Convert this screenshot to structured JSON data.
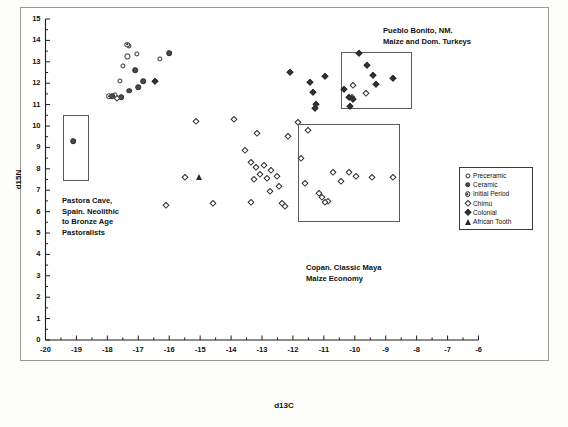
{
  "axes": {
    "xlabel": "d13C",
    "ylabel": "d15N",
    "xticks": [
      "-20",
      "-19",
      "-18",
      "-17",
      "-16",
      "-15",
      "-14",
      "-13",
      "-12",
      "-11",
      "-10",
      "-9",
      "-8",
      "-7",
      "-6"
    ],
    "yticks": [
      "0",
      "1",
      "2",
      "3",
      "4",
      "5",
      "6",
      "7",
      "8",
      "9",
      "10",
      "11",
      "12",
      "13",
      "14",
      "15"
    ],
    "xlim": [
      -20,
      -6
    ],
    "ylim": [
      0,
      15
    ]
  },
  "legend": {
    "items": [
      {
        "label": "Preceramic",
        "marker": "open-circle"
      },
      {
        "label": "Ceramic",
        "marker": "fill-circle"
      },
      {
        "label": "Initial Period",
        "marker": "circle-dot"
      },
      {
        "label": "Chimú",
        "marker": "open-diamond"
      },
      {
        "label": "Colonial",
        "marker": "fill-diamond"
      },
      {
        "label": "African Tooth",
        "marker": "fill-triangle"
      }
    ]
  },
  "annotations": [
    {
      "id": "annot-pastora",
      "text": "Pastora Cave,\nSpain. Neolithic\nto Bronze Age\nPastoralists"
    },
    {
      "id": "annot-pueblo",
      "text": "Pueblo Bonito, NM.\nMaize and Dom. Turkeys"
    },
    {
      "id": "annot-copan",
      "text": "Copan. Classic Maya\nMaize Economy"
    }
  ],
  "callout_boxes": [
    {
      "name": "pastora-cave-box",
      "x0": -19.45,
      "x1": -18.6,
      "y0": 7.45,
      "y1": 10.5
    },
    {
      "name": "pueblo-bonito-box",
      "x0": -10.45,
      "x1": -8.15,
      "y0": 10.8,
      "y1": 13.45
    },
    {
      "name": "copan-box",
      "x0": -11.85,
      "x1": -8.55,
      "y0": 5.5,
      "y1": 10.1
    }
  ],
  "chart_data": {
    "type": "scatter",
    "title": "",
    "xlabel": "d13C",
    "ylabel": "d15N",
    "xlim": [
      -20,
      -6
    ],
    "ylim": [
      0,
      15
    ],
    "grid": false,
    "legend_position": "right",
    "series": [
      {
        "name": "Preceramic",
        "marker": "open-circle",
        "points": [
          [
            -17.3,
            13.75
          ],
          [
            -17.35,
            13.25
          ],
          [
            -17.05,
            13.35
          ],
          [
            -16.3,
            13.15
          ],
          [
            -17.5,
            12.8
          ],
          [
            -17.6,
            12.1
          ],
          [
            -17.75,
            11.45
          ]
        ]
      },
      {
        "name": "Ceramic",
        "marker": "fill-circle",
        "points": [
          [
            -16.0,
            13.4
          ],
          [
            -17.1,
            12.6
          ],
          [
            -16.85,
            12.1
          ],
          [
            -17.0,
            11.8
          ],
          [
            -17.3,
            11.65
          ],
          [
            -17.55,
            11.35
          ],
          [
            -17.85,
            11.4
          ],
          [
            -19.1,
            9.3
          ]
        ]
      },
      {
        "name": "Initial Period",
        "marker": "circle-dot",
        "points": [
          [
            -17.35,
            13.8
          ],
          [
            -17.95,
            11.4
          ]
        ]
      },
      {
        "name": "Chimú",
        "marker": "open-diamond",
        "points": [
          [
            -17.7,
            11.3
          ],
          [
            -16.1,
            6.3
          ],
          [
            -15.15,
            10.25
          ],
          [
            -15.5,
            7.6
          ],
          [
            -14.6,
            6.4
          ],
          [
            -13.9,
            10.35
          ],
          [
            -13.55,
            8.9
          ],
          [
            -13.15,
            9.65
          ],
          [
            -13.35,
            8.3
          ],
          [
            -13.2,
            8.1
          ],
          [
            -12.95,
            8.2
          ],
          [
            -13.05,
            7.75
          ],
          [
            -13.25,
            7.5
          ],
          [
            -12.85,
            7.55
          ],
          [
            -12.7,
            7.95
          ],
          [
            -12.5,
            7.65
          ],
          [
            -12.75,
            6.95
          ],
          [
            -12.45,
            7.2
          ],
          [
            -13.35,
            6.45
          ],
          [
            -12.35,
            6.4
          ],
          [
            -12.25,
            6.25
          ],
          [
            -12.15,
            9.55
          ],
          [
            -11.85,
            10.2
          ],
          [
            -11.75,
            8.5
          ],
          [
            -11.6,
            7.35
          ],
          [
            -11.15,
            6.85
          ],
          [
            -11.05,
            6.7
          ],
          [
            -10.85,
            6.5
          ],
          [
            -10.95,
            6.45
          ],
          [
            -11.5,
            9.8
          ],
          [
            -10.7,
            7.85
          ],
          [
            -10.45,
            7.45
          ],
          [
            -10.2,
            7.85
          ],
          [
            -9.95,
            7.65
          ],
          [
            -9.45,
            7.6
          ],
          [
            -8.75,
            7.6
          ],
          [
            -10.1,
            11.35
          ],
          [
            -10.05,
            11.9
          ],
          [
            -9.65,
            11.55
          ]
        ]
      },
      {
        "name": "Colonial",
        "marker": "fill-diamond",
        "points": [
          [
            -16.45,
            12.1
          ],
          [
            -12.1,
            12.5
          ],
          [
            -11.45,
            12.05
          ],
          [
            -11.35,
            11.6
          ],
          [
            -11.25,
            11.05
          ],
          [
            -11.3,
            10.85
          ],
          [
            -10.95,
            12.35
          ],
          [
            -10.35,
            11.75
          ],
          [
            -10.2,
            11.35
          ],
          [
            -10.05,
            11.25
          ],
          [
            -10.15,
            10.95
          ],
          [
            -9.85,
            13.4
          ],
          [
            -9.6,
            12.85
          ],
          [
            -9.4,
            12.4
          ],
          [
            -9.3,
            11.95
          ],
          [
            -8.75,
            12.25
          ]
        ]
      },
      {
        "name": "African Tooth",
        "marker": "fill-triangle",
        "points": [
          [
            -15.05,
            7.6
          ]
        ]
      }
    ]
  }
}
